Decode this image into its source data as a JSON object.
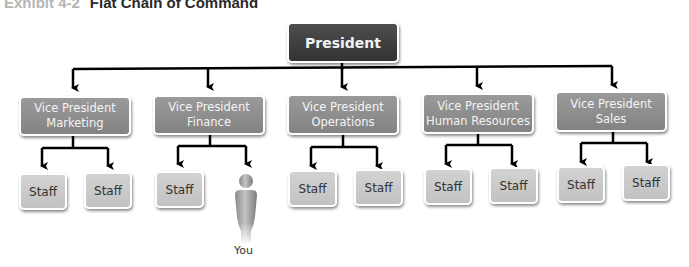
{
  "title": {
    "exhibit": "Exhibit 4-2",
    "text": "Flat Chain of Command"
  },
  "president": {
    "label": "President",
    "color": "#3d3d3d"
  },
  "vice_presidents": [
    {
      "line1": "Vice President",
      "line2": "Marketing",
      "staff": [
        "Staff",
        "Staff"
      ]
    },
    {
      "line1": "Vice President",
      "line2": "Finance",
      "staff": [
        "Staff"
      ],
      "you": "You"
    },
    {
      "line1": "Vice President",
      "line2": "Operations",
      "staff": [
        "Staff",
        "Staff"
      ]
    },
    {
      "line1": "Vice President",
      "line2": "Human Resources",
      "staff": [
        "Staff",
        "Staff"
      ]
    },
    {
      "line1": "Vice President",
      "line2": "Sales",
      "staff": [
        "Staff",
        "Staff"
      ]
    }
  ],
  "colors": {
    "vp_box": "#8e8e8e",
    "staff_box": "#c9c9c9",
    "connector": "#000000"
  }
}
